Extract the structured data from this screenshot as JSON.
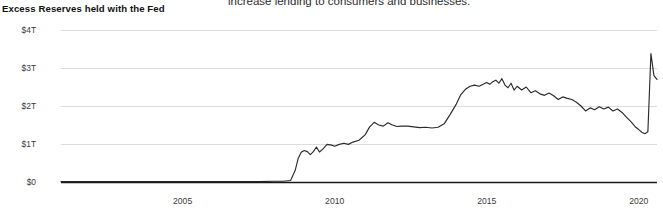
{
  "caption": {
    "text": "increase lending to consumers and businesses."
  },
  "chart": {
    "title": "Excess Reserves held with the Fed"
  },
  "chart_data": {
    "type": "line",
    "title": "Excess Reserves held with the Fed",
    "xlabel": "",
    "ylabel": "",
    "units": "USD trillions",
    "grid": true,
    "legend": "none",
    "xlim": [
      2001.0,
      2020.6
    ],
    "ylim": [
      0,
      4
    ],
    "xticks": [
      2005,
      2010,
      2015,
      2020
    ],
    "xtick_labels": [
      "2005",
      "2010",
      "2015",
      "2020"
    ],
    "yticks": [
      0,
      1,
      2,
      3,
      4
    ],
    "ytick_labels": [
      "$0",
      "$1T",
      "$2T",
      "$3T",
      "$4T"
    ],
    "series": [
      {
        "name": "Excess Reserves held with the Fed",
        "color": "#2b2b2b",
        "x": [
          2001.0,
          2001.5,
          2002.0,
          2002.5,
          2003.0,
          2003.5,
          2004.0,
          2004.5,
          2005.0,
          2005.5,
          2006.0,
          2006.5,
          2007.0,
          2007.5,
          2008.0,
          2008.3,
          2008.55,
          2008.7,
          2008.8,
          2008.9,
          2009.0,
          2009.1,
          2009.2,
          2009.3,
          2009.4,
          2009.5,
          2009.6,
          2009.75,
          2009.9,
          2010.0,
          2010.15,
          2010.3,
          2010.45,
          2010.6,
          2010.8,
          2011.0,
          2011.15,
          2011.3,
          2011.45,
          2011.6,
          2011.75,
          2011.9,
          2012.05,
          2012.2,
          2012.4,
          2012.6,
          2012.8,
          2013.0,
          2013.2,
          2013.4,
          2013.6,
          2013.8,
          2014.0,
          2014.15,
          2014.3,
          2014.45,
          2014.6,
          2014.75,
          2014.9,
          2015.0,
          2015.1,
          2015.2,
          2015.3,
          2015.4,
          2015.5,
          2015.6,
          2015.7,
          2015.8,
          2015.9,
          2016.0,
          2016.15,
          2016.3,
          2016.45,
          2016.6,
          2016.75,
          2016.9,
          2017.05,
          2017.2,
          2017.35,
          2017.5,
          2017.65,
          2017.8,
          2017.95,
          2018.1,
          2018.25,
          2018.4,
          2018.55,
          2018.7,
          2018.85,
          2019.0,
          2019.15,
          2019.3,
          2019.45,
          2019.6,
          2019.75,
          2019.9,
          2020.0,
          2020.1,
          2020.2,
          2020.3,
          2020.4,
          2020.5,
          2020.6
        ],
        "y": [
          0.01,
          0.01,
          0.01,
          0.01,
          0.01,
          0.01,
          0.01,
          0.01,
          0.01,
          0.01,
          0.01,
          0.01,
          0.01,
          0.01,
          0.02,
          0.02,
          0.04,
          0.3,
          0.62,
          0.78,
          0.83,
          0.8,
          0.72,
          0.8,
          0.92,
          0.79,
          0.86,
          0.99,
          0.97,
          0.94,
          0.99,
          1.02,
          0.99,
          1.05,
          1.1,
          1.24,
          1.45,
          1.57,
          1.5,
          1.47,
          1.56,
          1.5,
          1.46,
          1.47,
          1.47,
          1.45,
          1.43,
          1.44,
          1.42,
          1.44,
          1.53,
          1.78,
          2.05,
          2.3,
          2.44,
          2.52,
          2.55,
          2.52,
          2.58,
          2.62,
          2.57,
          2.64,
          2.68,
          2.6,
          2.72,
          2.55,
          2.48,
          2.6,
          2.42,
          2.52,
          2.42,
          2.5,
          2.35,
          2.4,
          2.32,
          2.28,
          2.34,
          2.27,
          2.17,
          2.24,
          2.2,
          2.17,
          2.1,
          2.0,
          1.87,
          1.95,
          1.9,
          1.98,
          1.92,
          1.97,
          1.87,
          1.92,
          1.83,
          1.7,
          1.58,
          1.44,
          1.38,
          1.31,
          1.27,
          1.32,
          3.38,
          2.8,
          2.7
        ]
      }
    ]
  }
}
